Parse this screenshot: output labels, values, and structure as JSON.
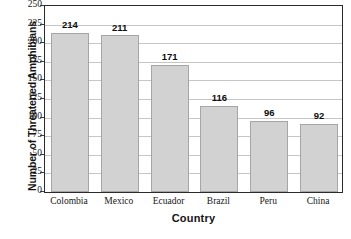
{
  "chart_data": {
    "type": "bar",
    "title": "",
    "xlabel": "Country",
    "ylabel": "Number of Threatened Amphibians",
    "categories": [
      "Colombia",
      "Mexico",
      "Ecuador",
      "Brazil",
      "Peru",
      "China"
    ],
    "values": [
      214,
      211,
      171,
      116,
      96,
      92
    ],
    "value_labels": [
      "214",
      "211",
      "171",
      "116",
      "96",
      "92"
    ],
    "ylim": [
      0,
      250
    ],
    "ytick_step": 25,
    "ytick_labels": [
      "250",
      "225",
      "200",
      "175",
      "150",
      "125",
      "100",
      "75",
      "50",
      "25",
      "0"
    ],
    "grid": "horizontal",
    "legend": "none",
    "colors": {
      "bar_fill": "#d2d2d2",
      "bar_stroke": "#a6a6a6",
      "gridline": "#c6c6c6",
      "axis": "#2b2b2b",
      "text": "#141414"
    }
  }
}
